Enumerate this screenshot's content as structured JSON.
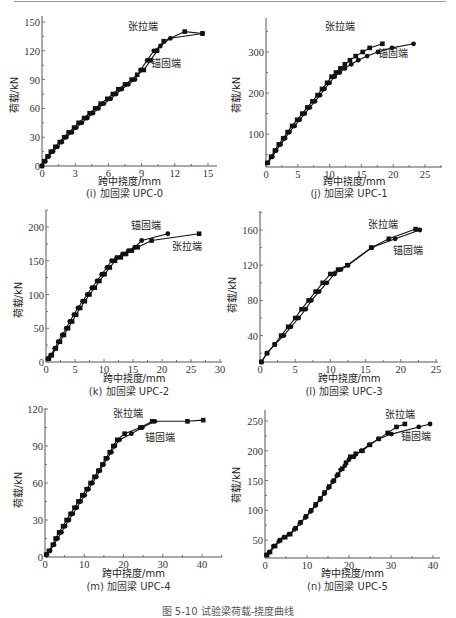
{
  "figure": {
    "caption": "图 5-10   试验梁荷载-挠度曲线"
  },
  "chart_data": [
    {
      "id": "i",
      "type": "line",
      "caption": "(i) 加固梁 UPC-0",
      "xlabel": "跨中挠度/mm",
      "ylabel": "荷载/kN",
      "xlim": [
        0,
        16
      ],
      "ylim": [
        0,
        155
      ],
      "xticks": [
        0,
        3,
        6,
        9,
        12,
        15
      ],
      "yticks": [
        0,
        30,
        60,
        90,
        120,
        150
      ],
      "frame": {
        "x0": 42,
        "x15": 208,
        "xend": 217,
        "y0": 166,
        "ytop": 17,
        "ytopVal": 155
      },
      "annotations": [
        {
          "text": "张拉端",
          "x": 128,
          "y": 30
        },
        {
          "text": "锚固端",
          "x": 151,
          "y": 67
        }
      ],
      "series": [
        {
          "name": "张拉端",
          "marker": "square",
          "x": [
            0,
            0.2,
            0.5,
            0.8,
            1.2,
            1.6,
            2.0,
            2.4,
            2.9,
            3.3,
            3.8,
            4.3,
            4.8,
            5.3,
            5.9,
            6.4,
            6.9,
            7.5,
            8.1,
            8.6,
            9.2,
            9.8,
            10.4,
            11.0,
            12.9,
            14.5
          ],
          "y": [
            0,
            5,
            10,
            15,
            20,
            25,
            30,
            35,
            40,
            45,
            50,
            55,
            60,
            65,
            70,
            75,
            80,
            85,
            90,
            95,
            100,
            110,
            120,
            130,
            140,
            138
          ]
        },
        {
          "name": "锚固端",
          "marker": "circle",
          "x": [
            0,
            0.3,
            0.6,
            1.0,
            1.4,
            1.8,
            2.2,
            2.7,
            3.1,
            3.6,
            4.1,
            4.6,
            5.1,
            5.6,
            6.2,
            6.7,
            7.2,
            7.8,
            8.4,
            8.9,
            9.5,
            10.1,
            10.7,
            11.6,
            14.5
          ],
          "y": [
            0,
            5,
            10,
            15,
            20,
            25,
            30,
            35,
            40,
            45,
            50,
            55,
            60,
            65,
            70,
            75,
            80,
            85,
            90,
            100,
            110,
            120,
            125,
            133,
            138
          ]
        }
      ]
    },
    {
      "id": "j",
      "type": "line",
      "caption": "(j) 加固梁 UPC-1",
      "xlabel": "跨中挠度/mm",
      "ylabel": "荷载/kN",
      "xlim": [
        0,
        27
      ],
      "ylim": [
        20,
        340
      ],
      "xticks": [
        0,
        5,
        10,
        15,
        20,
        25
      ],
      "yticks": [
        100,
        200,
        300
      ],
      "frame": {
        "x0": 266,
        "x25": 425,
        "xend": 442
      },
      "annotations": [
        {
          "text": "张拉端",
          "x": 325,
          "y": 30
        },
        {
          "text": "锚固端",
          "x": 378,
          "y": 57
        }
      ],
      "series": [
        {
          "name": "张拉端",
          "marker": "square",
          "x": [
            0.2,
            0.8,
            1.4,
            2.0,
            2.7,
            3.4,
            4.1,
            4.9,
            5.7,
            6.5,
            7.3,
            8.1,
            8.8,
            9.6,
            10.3,
            11.0,
            11.7,
            12.4,
            13.2,
            14.1,
            15.2,
            16.3,
            18.3
          ],
          "y": [
            30,
            45,
            60,
            75,
            90,
            105,
            120,
            135,
            150,
            165,
            180,
            195,
            210,
            225,
            240,
            250,
            260,
            270,
            280,
            290,
            300,
            310,
            320
          ]
        },
        {
          "name": "锚固端",
          "marker": "circle",
          "x": [
            0.3,
            1.0,
            1.6,
            2.3,
            3.0,
            3.7,
            4.5,
            5.3,
            6.1,
            6.9,
            7.7,
            8.5,
            9.2,
            10.0,
            10.8,
            11.6,
            12.4,
            13.4,
            14.5,
            15.9,
            17.6,
            19.8,
            23.2
          ],
          "y": [
            30,
            45,
            60,
            75,
            90,
            105,
            120,
            135,
            150,
            165,
            180,
            195,
            210,
            225,
            240,
            250,
            260,
            270,
            280,
            290,
            300,
            310,
            320
          ]
        }
      ]
    },
    {
      "id": "k",
      "type": "line",
      "caption": "(k) 加固梁 UPC-2",
      "xlabel": "跨中挠度/mm",
      "ylabel": "荷载/kN",
      "xlim": [
        0,
        30
      ],
      "ylim": [
        0,
        225
      ],
      "xticks": [
        0,
        5,
        10,
        15,
        20,
        25,
        30
      ],
      "yticks": [
        0,
        50,
        100,
        150,
        200
      ],
      "frame": {
        "x0": 46,
        "x30": 220,
        "xend": 222
      },
      "annotations": [
        {
          "text": "锚固端",
          "x": 131,
          "y": 229
        },
        {
          "text": "张拉端",
          "x": 172,
          "y": 250
        }
      ],
      "series": [
        {
          "name": "锚固端",
          "marker": "circle",
          "x": [
            0.3,
            0.8,
            1.5,
            2.1,
            2.8,
            3.5,
            4.1,
            4.8,
            5.5,
            6.3,
            7.1,
            7.9,
            8.8,
            9.6,
            10.5,
            11.3,
            12.2,
            13.2,
            14.2,
            15.3,
            16.5,
            21.0
          ],
          "y": [
            5,
            10,
            20,
            30,
            40,
            50,
            60,
            70,
            80,
            90,
            100,
            110,
            120,
            130,
            140,
            150,
            155,
            160,
            165,
            170,
            180,
            190
          ]
        },
        {
          "name": "张拉端",
          "marker": "square",
          "x": [
            0.5,
            1.0,
            1.7,
            2.4,
            3.1,
            3.8,
            4.5,
            5.2,
            5.9,
            6.7,
            7.5,
            8.4,
            9.2,
            10.1,
            11.0,
            11.9,
            12.9,
            13.8,
            14.8,
            15.8,
            18.2,
            26.4
          ],
          "y": [
            5,
            10,
            20,
            30,
            40,
            50,
            60,
            70,
            80,
            90,
            100,
            110,
            120,
            130,
            140,
            150,
            155,
            160,
            165,
            170,
            180,
            190
          ]
        }
      ]
    },
    {
      "id": "l",
      "type": "line",
      "caption": "(l) 加固梁 UPC-3",
      "xlabel": "跨中挠度/mm",
      "ylabel": "荷载/kN",
      "xlim": [
        0,
        25
      ],
      "ylim": [
        10,
        180
      ],
      "xticks": [
        0,
        5,
        10,
        15,
        20,
        25
      ],
      "yticks": [
        40,
        80,
        120,
        160
      ],
      "frame": {
        "x0": 260,
        "x25": 436,
        "xend": 438
      },
      "annotations": [
        {
          "text": "张拉端",
          "x": 368,
          "y": 228
        },
        {
          "text": "锚固端",
          "x": 393,
          "y": 254
        }
      ],
      "series": [
        {
          "name": "张拉端",
          "marker": "square",
          "x": [
            0.2,
            1.0,
            2.1,
            3.0,
            4.0,
            5.0,
            5.9,
            6.9,
            7.9,
            8.9,
            10.0,
            11.1,
            12.4,
            15.8,
            18.3,
            22.1
          ],
          "y": [
            10,
            20,
            30,
            40,
            50,
            60,
            70,
            80,
            90,
            100,
            110,
            115,
            120,
            140,
            150,
            161
          ]
        },
        {
          "name": "锚固端",
          "marker": "circle",
          "x": [
            0.2,
            1.0,
            2.1,
            3.4,
            4.4,
            5.5,
            6.5,
            7.3,
            8.4,
            9.5,
            10.6,
            11.5,
            12.5,
            15.9,
            19.2,
            22.7
          ],
          "y": [
            10,
            20,
            30,
            40,
            50,
            60,
            70,
            80,
            90,
            100,
            110,
            115,
            120,
            140,
            150,
            160
          ]
        }
      ]
    },
    {
      "id": "m",
      "type": "line",
      "caption": "(m) 加固梁 UPC-4",
      "xlabel": "跨中挠度/mm",
      "ylabel": "荷载/kN",
      "xlim": [
        0,
        45
      ],
      "ylim": [
        0,
        120
      ],
      "xticks": [
        0,
        10,
        20,
        30,
        40
      ],
      "yticks": [
        0,
        30,
        60,
        90,
        120
      ],
      "frame": {
        "x0": 45,
        "x40": 202,
        "xend": 222
      },
      "annotations": [
        {
          "text": "张拉端",
          "x": 113,
          "y": 417
        },
        {
          "text": "锚固端",
          "x": 145,
          "y": 441
        }
      ],
      "series": [
        {
          "name": "张拉端",
          "marker": "square",
          "x": [
            0.3,
            1.0,
            2.0,
            2.7,
            3.6,
            4.6,
            5.5,
            6.5,
            7.5,
            8.5,
            9.5,
            10.6,
            11.6,
            12.6,
            13.6,
            14.6,
            15.5,
            16.5,
            17.4,
            18.4,
            20.3,
            24.3,
            27.3,
            36.3,
            40.3
          ],
          "y": [
            2,
            5,
            10,
            15,
            20,
            25,
            30,
            35,
            40,
            45,
            50,
            55,
            60,
            65,
            70,
            75,
            80,
            85,
            90,
            95,
            100,
            105,
            110,
            110,
            111
          ]
        },
        {
          "name": "锚固端",
          "marker": "circle",
          "x": [
            0.5,
            1.3,
            2.3,
            3.2,
            4.2,
            5.1,
            6.1,
            7.1,
            8.1,
            9.1,
            10.1,
            11.1,
            12.1,
            13.1,
            14.0,
            14.9,
            15.9,
            16.9,
            17.8,
            19.0,
            22.0,
            24.8,
            28.0
          ],
          "y": [
            2,
            5,
            10,
            15,
            20,
            25,
            30,
            35,
            40,
            45,
            50,
            55,
            60,
            65,
            70,
            75,
            80,
            85,
            90,
            95,
            100,
            105,
            110
          ]
        }
      ]
    },
    {
      "id": "n",
      "type": "line",
      "caption": "(n) 加固梁 UPC-5",
      "xlabel": "跨中挠度/mm",
      "ylabel": "荷载/kN",
      "xlim": [
        0,
        42
      ],
      "ylim": [
        20,
        270
      ],
      "xticks": [
        0,
        10,
        20,
        30,
        40
      ],
      "yticks": [
        50,
        100,
        150,
        200,
        250
      ],
      "frame": {
        "x0": 265,
        "x40": 433,
        "xend": 440
      },
      "annotations": [
        {
          "text": "张拉端",
          "x": 385,
          "y": 418
        },
        {
          "text": "锚固端",
          "x": 401,
          "y": 440
        }
      ],
      "series": [
        {
          "name": "张拉端",
          "marker": "square",
          "x": [
            0.5,
            1.2,
            2.4,
            3.6,
            4.8,
            6.0,
            7.3,
            8.5,
            9.8,
            11.0,
            12.1,
            13.2,
            14.2,
            15.3,
            16.4,
            17.4,
            18.4,
            19.3,
            20.3,
            21.6,
            23.2,
            25.0,
            27.1,
            29.2,
            31.3,
            33.3
          ],
          "y": [
            25,
            30,
            40,
            50,
            55,
            60,
            70,
            80,
            90,
            100,
            110,
            120,
            130,
            140,
            150,
            160,
            170,
            180,
            190,
            195,
            200,
            210,
            220,
            230,
            240,
            245
          ]
        },
        {
          "name": "锚固端",
          "marker": "circle",
          "x": [
            0.3,
            1.0,
            2.0,
            3.3,
            4.5,
            5.7,
            7.0,
            8.3,
            9.6,
            10.8,
            12.0,
            13.1,
            14.1,
            15.1,
            16.1,
            17.1,
            18.0,
            19.0,
            20.0,
            21.2,
            22.9,
            24.8,
            27.0,
            30.1,
            36.6,
            39.3
          ],
          "y": [
            25,
            30,
            40,
            48,
            55,
            60,
            68,
            78,
            88,
            98,
            108,
            118,
            128,
            138,
            148,
            158,
            168,
            175,
            185,
            190,
            200,
            210,
            220,
            228,
            240,
            245
          ]
        }
      ]
    }
  ]
}
